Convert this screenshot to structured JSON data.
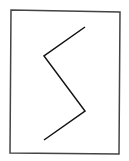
{
  "figure": {
    "width": 129,
    "height": 161,
    "background": "#ffffff",
    "frame": {
      "points": [
        [
          11,
          10
        ],
        [
          120,
          12
        ],
        [
          119,
          154
        ],
        [
          10,
          153
        ]
      ],
      "stroke": "#444444",
      "stroke_width": 1.5
    },
    "zigzag": {
      "points": [
        [
          85,
          27
        ],
        [
          44,
          56
        ],
        [
          85,
          111
        ],
        [
          44,
          140
        ]
      ],
      "stroke": "#111111",
      "stroke_width": 1.5
    }
  }
}
